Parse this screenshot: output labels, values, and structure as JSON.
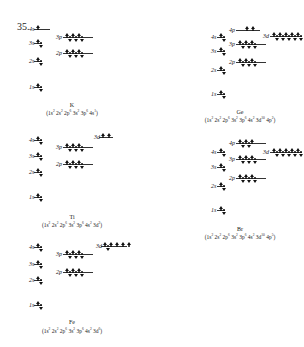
{
  "problem_number": "35.",
  "diagrams": [
    {
      "element": "K",
      "config_parts": [
        [
          "1s",
          "2"
        ],
        [
          "2s",
          "2"
        ],
        [
          "2p",
          "6"
        ],
        [
          "3s",
          "2"
        ],
        [
          "3p",
          "6"
        ],
        [
          "4s",
          "1"
        ]
      ],
      "label_x": 2,
      "label_y": 102,
      "cfg_y": 109,
      "orbitals": [
        {
          "name": "4s",
          "x": 37,
          "y": 29,
          "lx": 29,
          "count": 1,
          "electrons": [
            1
          ],
          "line_w": 16
        },
        {
          "name": "3s",
          "x": 37,
          "y": 43,
          "lx": 29,
          "count": 1,
          "electrons": [
            2
          ],
          "line_w": 8
        },
        {
          "name": "3p",
          "x": 66,
          "y": 37,
          "lx": 56,
          "count": 3,
          "electrons": [
            2,
            2,
            2
          ],
          "line_w": 30
        },
        {
          "name": "2s",
          "x": 37,
          "y": 61,
          "lx": 29,
          "count": 1,
          "electrons": [
            2
          ],
          "line_w": 8
        },
        {
          "name": "2p",
          "x": 66,
          "y": 53,
          "lx": 56,
          "count": 3,
          "electrons": [
            2,
            2,
            2
          ],
          "line_w": 30
        },
        {
          "name": "1s",
          "x": 37,
          "y": 87,
          "lx": 29,
          "count": 1,
          "electrons": [
            2
          ],
          "line_w": 8
        }
      ]
    },
    {
      "element": "Ti",
      "config_parts": [
        [
          "1s",
          "2"
        ],
        [
          "2s",
          "2"
        ],
        [
          "2p",
          "6"
        ],
        [
          "3s",
          "2"
        ],
        [
          "3p",
          "6"
        ],
        [
          "4s",
          "2"
        ],
        [
          "3d",
          "2"
        ]
      ],
      "label_x": 2,
      "label_y": 214,
      "cfg_y": 221,
      "orbitals": [
        {
          "name": "4s",
          "x": 37,
          "y": 140,
          "lx": 29,
          "count": 1,
          "electrons": [
            2
          ],
          "line_w": 8
        },
        {
          "name": "3d",
          "x": 102,
          "y": 137,
          "lx": 94,
          "count": 2,
          "electrons": [
            1,
            1
          ],
          "line_w": 14
        },
        {
          "name": "3p",
          "x": 66,
          "y": 147,
          "lx": 56,
          "count": 3,
          "electrons": [
            2,
            2,
            2
          ],
          "line_w": 30
        },
        {
          "name": "3s",
          "x": 37,
          "y": 156,
          "lx": 29,
          "count": 1,
          "electrons": [
            2
          ],
          "line_w": 8
        },
        {
          "name": "2p",
          "x": 66,
          "y": 164,
          "lx": 56,
          "count": 3,
          "electrons": [
            2,
            2,
            2
          ],
          "line_w": 30
        },
        {
          "name": "2s",
          "x": 37,
          "y": 172,
          "lx": 29,
          "count": 1,
          "electrons": [
            2
          ],
          "line_w": 8
        },
        {
          "name": "1s",
          "x": 37,
          "y": 197,
          "lx": 29,
          "count": 1,
          "electrons": [
            2
          ],
          "line_w": 8
        }
      ]
    },
    {
      "element": "Fe",
      "config_parts": [
        [
          "1s",
          "2"
        ],
        [
          "2s",
          "2"
        ],
        [
          "2p",
          "6"
        ],
        [
          "3s",
          "2"
        ],
        [
          "3p",
          "6"
        ],
        [
          "4s",
          "2"
        ],
        [
          "3d",
          "6"
        ]
      ],
      "label_x": 2,
      "label_y": 319,
      "cfg_y": 327,
      "orbitals": [
        {
          "name": "4s",
          "x": 37,
          "y": 247,
          "lx": 29,
          "count": 1,
          "electrons": [
            2
          ],
          "line_w": 8
        },
        {
          "name": "3d",
          "x": 104,
          "y": 246,
          "lx": 96,
          "count": 5,
          "electrons": [
            2,
            1,
            1,
            1,
            1
          ],
          "line_w": 26
        },
        {
          "name": "3p",
          "x": 66,
          "y": 254,
          "lx": 56,
          "count": 3,
          "electrons": [
            2,
            2,
            2
          ],
          "line_w": 30
        },
        {
          "name": "3s",
          "x": 37,
          "y": 264,
          "lx": 29,
          "count": 1,
          "electrons": [
            2
          ],
          "line_w": 8
        },
        {
          "name": "2p",
          "x": 66,
          "y": 272,
          "lx": 56,
          "count": 3,
          "electrons": [
            2,
            2,
            2
          ],
          "line_w": 30
        },
        {
          "name": "2s",
          "x": 37,
          "y": 280,
          "lx": 29,
          "count": 1,
          "electrons": [
            2
          ],
          "line_w": 8
        },
        {
          "name": "1s",
          "x": 37,
          "y": 305,
          "lx": 29,
          "count": 1,
          "electrons": [
            2
          ],
          "line_w": 8
        }
      ]
    },
    {
      "element": "Ge",
      "config_parts": [
        [
          "1s",
          "2"
        ],
        [
          "2s",
          "2"
        ],
        [
          "2p",
          "6"
        ],
        [
          "3s",
          "2"
        ],
        [
          "3p",
          "6"
        ],
        [
          "4s",
          "2"
        ],
        [
          "3d",
          "10"
        ],
        [
          "4p",
          "2"
        ]
      ],
      "label_x": 170,
      "label_y": 109,
      "cfg_y": 116,
      "orbitals": [
        {
          "name": "4p",
          "x": 246,
          "y": 30,
          "lx": 229,
          "count": 1,
          "electrons": [
            1,
            1
          ],
          "line_w": 24,
          "line_x": 236
        },
        {
          "name": "3d",
          "x": 273,
          "y": 36,
          "lx": 263,
          "count": 5,
          "electrons": [
            2,
            2,
            2,
            2,
            2
          ],
          "line_w": 32
        },
        {
          "name": "4s",
          "x": 220,
          "y": 37,
          "lx": 211,
          "count": 1,
          "electrons": [
            2
          ],
          "line_w": 8
        },
        {
          "name": "3p",
          "x": 239,
          "y": 44,
          "lx": 229,
          "count": 3,
          "electrons": [
            2,
            2,
            2
          ],
          "line_w": 30
        },
        {
          "name": "3s",
          "x": 220,
          "y": 51,
          "lx": 211,
          "count": 1,
          "electrons": [
            2
          ],
          "line_w": 8
        },
        {
          "name": "2p",
          "x": 239,
          "y": 62,
          "lx": 229,
          "count": 3,
          "electrons": [
            2,
            2,
            2
          ],
          "line_w": 30
        },
        {
          "name": "2s",
          "x": 220,
          "y": 70,
          "lx": 211,
          "count": 1,
          "electrons": [
            2
          ],
          "line_w": 8
        },
        {
          "name": "1s",
          "x": 220,
          "y": 94,
          "lx": 211,
          "count": 1,
          "electrons": [
            2
          ],
          "line_w": 8
        }
      ]
    },
    {
      "element": "Br",
      "config_parts": [
        [
          "1s",
          "2"
        ],
        [
          "2s",
          "2"
        ],
        [
          "2p",
          "6"
        ],
        [
          "3s",
          "2"
        ],
        [
          "3p",
          "6"
        ],
        [
          "4s",
          "2"
        ],
        [
          "3d",
          "10"
        ],
        [
          "4p",
          "5"
        ]
      ],
      "label_x": 170,
      "label_y": 226,
      "cfg_y": 233,
      "orbitals": [
        {
          "name": "4p",
          "x": 239,
          "y": 143,
          "lx": 229,
          "count": 3,
          "electrons": [
            2,
            2,
            1
          ],
          "line_w": 30
        },
        {
          "name": "4s",
          "x": 220,
          "y": 152,
          "lx": 211,
          "count": 1,
          "electrons": [
            2
          ],
          "line_w": 8
        },
        {
          "name": "3d",
          "x": 273,
          "y": 152,
          "lx": 263,
          "count": 5,
          "electrons": [
            2,
            2,
            2,
            2,
            2
          ],
          "line_w": 32
        },
        {
          "name": "3p",
          "x": 239,
          "y": 159,
          "lx": 229,
          "count": 3,
          "electrons": [
            2,
            2,
            2
          ],
          "line_w": 30
        },
        {
          "name": "3s",
          "x": 220,
          "y": 167,
          "lx": 211,
          "count": 1,
          "electrons": [
            2
          ],
          "line_w": 8
        },
        {
          "name": "2p",
          "x": 239,
          "y": 178,
          "lx": 229,
          "count": 3,
          "electrons": [
            2,
            2,
            2
          ],
          "line_w": 30
        },
        {
          "name": "2s",
          "x": 220,
          "y": 186,
          "lx": 211,
          "count": 1,
          "electrons": [
            2
          ],
          "line_w": 8
        },
        {
          "name": "1s",
          "x": 220,
          "y": 210,
          "lx": 211,
          "count": 1,
          "electrons": [
            2
          ],
          "line_w": 8
        }
      ]
    }
  ]
}
